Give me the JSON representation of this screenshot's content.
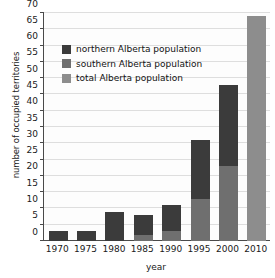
{
  "chart_data": {
    "type": "bar",
    "title": "",
    "subtitle": "",
    "xlabel": "year",
    "ylabel": "number of occupied territories",
    "categories": [
      "1970",
      "1975",
      "1980",
      "1985",
      "1990",
      "1995",
      "2000",
      "2010"
    ],
    "ylim": [
      0,
      70
    ],
    "yticks": [
      0,
      5,
      10,
      15,
      20,
      25,
      30,
      35,
      40,
      45,
      50,
      55,
      60,
      65,
      70
    ],
    "ytick_labels": [
      "0",
      "5",
      "10",
      "15",
      "20",
      "25",
      "30",
      "35",
      "40",
      "45",
      "50",
      "55",
      "60",
      "65",
      "70"
    ],
    "grid": true,
    "stacked": true,
    "legend_position": "upper left",
    "series": [
      {
        "name": "total Alberta population",
        "color": "#8d8d8d",
        "values": [
          0,
          0,
          0,
          0,
          0,
          0,
          0,
          69
        ]
      },
      {
        "name": "southern Alberta population",
        "color": "#6f6f6f",
        "values": [
          0,
          0,
          0,
          2,
          3,
          13,
          23,
          0
        ]
      },
      {
        "name": "northern Alberta population",
        "color": "#3b3b3b",
        "values": [
          3,
          3,
          9,
          6,
          8,
          18,
          25,
          0
        ]
      }
    ],
    "bar_totals": [
      3,
      3,
      9,
      8,
      11,
      31,
      48,
      69
    ],
    "annotations": []
  },
  "legend": {
    "items": [
      {
        "label": "northern Alberta population",
        "color": "#3b3b3b"
      },
      {
        "label": "southern Alberta population",
        "color": "#6f6f6f"
      },
      {
        "label": "total Alberta population",
        "color": "#8d8d8d"
      }
    ]
  },
  "colors": {
    "northern": "#3b3b3b",
    "southern": "#6f6f6f",
    "total": "#8d8d8d",
    "axis": "#4a4a4a",
    "grid": "#dedede",
    "text": "#1a1a1a",
    "background": "#ffffff"
  }
}
